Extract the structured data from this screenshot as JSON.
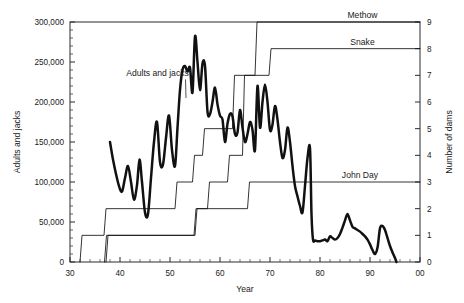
{
  "chart_data": {
    "type": "line",
    "title": "",
    "xlabel": "Year",
    "ylabel": "Adults and jacks",
    "y2label": "Number of dams",
    "xlim": [
      30,
      100
    ],
    "ylim": [
      0,
      300000
    ],
    "y2lim": [
      0,
      9
    ],
    "grid": false,
    "legend_position": "inline-right",
    "x_tick_labels": [
      "30",
      "40",
      "50",
      "60",
      "70",
      "80",
      "90",
      "00"
    ],
    "x_tick_values": [
      30,
      40,
      50,
      60,
      70,
      80,
      90,
      100
    ],
    "y_tick_labels": [
      "0",
      "50,000",
      "100,000",
      "150,000",
      "200,000",
      "250,000",
      "300,000"
    ],
    "y_tick_values": [
      0,
      50000,
      100000,
      150000,
      200000,
      250000,
      300000
    ],
    "y2_tick_labels": [
      "0",
      "1",
      "2",
      "3",
      "4",
      "5",
      "6",
      "7",
      "8",
      "9"
    ],
    "y2_tick_values": [
      0,
      1,
      2,
      3,
      4,
      5,
      6,
      7,
      8,
      9
    ],
    "annotations": [
      {
        "text": "Adults and jacks",
        "x": 47.5,
        "y": 232000,
        "leader_to_x": 53.2,
        "leader_to_y": 205000
      }
    ],
    "series": [
      {
        "name": "Adults and jacks",
        "axis": "left",
        "style": "thick",
        "x": [
          38,
          38.6,
          39.2,
          39.8,
          40.4,
          41,
          41.6,
          42.2,
          42.8,
          43.4,
          43.9,
          44.4,
          45,
          45.6,
          46.2,
          46.8,
          47.4,
          48,
          48.6,
          49.2,
          49.8,
          50.4,
          51,
          51.5,
          52,
          52.5,
          53,
          53.5,
          54,
          54.5,
          55,
          55.5,
          56,
          56.5,
          57,
          57.5,
          58,
          58.5,
          59,
          59.5,
          60,
          60.5,
          61,
          61.5,
          62,
          62.5,
          63,
          63.5,
          64,
          64.5,
          65,
          65.5,
          66,
          66.5,
          67,
          67.5,
          68,
          68.5,
          69,
          69.5,
          70,
          70.5,
          71,
          71.5,
          72,
          72.5,
          73,
          73.5,
          74,
          74.5,
          75,
          75.5,
          76,
          76.5,
          77,
          77.5,
          78,
          78.3,
          78.6,
          79,
          79.5,
          80,
          80.5,
          81,
          81.5,
          82,
          82.5,
          83,
          83.5,
          84,
          84.5,
          85,
          85.5,
          86,
          86.5,
          87,
          87.5,
          88,
          88.5,
          89,
          89.5,
          90,
          90.5,
          91,
          91.5,
          92,
          92.5,
          93,
          93.5,
          94,
          94.5,
          95,
          95.3
        ],
        "y": [
          150000,
          128000,
          110000,
          95000,
          88000,
          105000,
          120000,
          100000,
          78000,
          96000,
          128000,
          100000,
          62000,
          60000,
          105000,
          150000,
          175000,
          125000,
          122000,
          155000,
          183000,
          140000,
          120000,
          168000,
          215000,
          240000,
          245000,
          238000,
          243000,
          212000,
          282000,
          250000,
          215000,
          248000,
          245000,
          188000,
          185000,
          200000,
          218000,
          197000,
          183000,
          178000,
          150000,
          173000,
          185000,
          182000,
          160000,
          162000,
          190000,
          168000,
          150000,
          160000,
          175000,
          165000,
          140000,
          220000,
          168000,
          200000,
          222000,
          200000,
          165000,
          172000,
          195000,
          178000,
          150000,
          130000,
          140000,
          168000,
          150000,
          120000,
          95000,
          82000,
          70000,
          62000,
          95000,
          130000,
          142000,
          60000,
          28000,
          27000,
          26000,
          26000,
          27000,
          28000,
          26000,
          32000,
          30000,
          28000,
          30000,
          35000,
          43000,
          52000,
          60000,
          52000,
          44000,
          42000,
          40000,
          38000,
          35000,
          32000,
          28000,
          22000,
          15000,
          10000,
          18000,
          42000,
          45000,
          40000,
          30000,
          20000,
          12000,
          5000,
          0
        ]
      },
      {
        "name": "Methow",
        "axis": "right",
        "style": "step",
        "label_x": 88.5,
        "label_y": 9,
        "x": [
          32,
          32.4,
          36.8,
          37.2,
          51,
          51.4,
          54.5,
          54.9,
          56.5,
          56.9,
          62.5,
          62.9,
          67,
          67.4,
          100
        ],
        "y": [
          0,
          1,
          1,
          2,
          2,
          3,
          3,
          4,
          4,
          5,
          5,
          7,
          7,
          9,
          9
        ]
      },
      {
        "name": "Snake",
        "axis": "right",
        "style": "step",
        "label_x": 88.5,
        "label_y": 8,
        "x": [
          36.9,
          37.3,
          54.8,
          55.2,
          57.5,
          57.9,
          61.5,
          61.9,
          64.5,
          64.9,
          69.8,
          70.2,
          100
        ],
        "y": [
          0,
          1,
          1,
          2,
          2,
          3,
          3,
          4,
          4,
          7,
          7,
          8,
          8
        ]
      },
      {
        "name": "John Day",
        "axis": "right",
        "style": "step",
        "label_x": 88.0,
        "label_y": 3,
        "x": [
          37.2,
          37.6,
          55,
          55.4,
          65.5,
          65.9,
          100
        ],
        "y": [
          0,
          1,
          1,
          2,
          2,
          3,
          3
        ]
      }
    ]
  },
  "axes": {
    "x_title": "Year",
    "y_title": "Adults and jacks",
    "y2_title": "Number of dams"
  },
  "labels": {
    "methow": "Methow",
    "snake": "Snake",
    "john_day": "John Day",
    "adults_and_jacks": "Adults and jacks"
  }
}
